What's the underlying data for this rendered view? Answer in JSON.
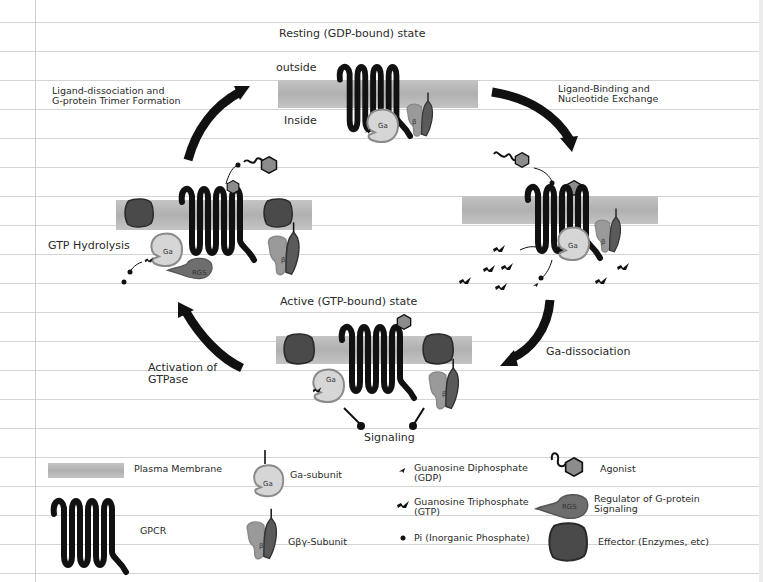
{
  "diagram": {
    "states": {
      "resting": "Resting (GDP-bound) state",
      "active": "Active (GTP-bound) state"
    },
    "membrane_labels": {
      "outside": "outside",
      "inside": "Inside"
    },
    "steps": {
      "ligand_binding": [
        "Ligand-Binding and",
        "Nucleotide Exchange"
      ],
      "ga_dissociation": "Ga-dissociation",
      "activation_gtpase": [
        "Activation of",
        "GTPase"
      ],
      "gtp_hydrolysis": "GTP Hydrolysis",
      "ligand_dissociation": [
        "Ligand-dissociation and",
        "G-protein Trimer Formation"
      ],
      "signaling": "Signaling"
    },
    "shape_labels": {
      "ga": "Ga",
      "beta": "β",
      "gamma": "γ",
      "rgs": "RGS",
      "effector": "Effector"
    }
  },
  "legend": {
    "items": [
      {
        "key": "plasma-membrane",
        "label": "Plasma Membrane"
      },
      {
        "key": "gpcr",
        "label": "GPCR"
      },
      {
        "key": "ga-subunit",
        "label": "Ga-subunit"
      },
      {
        "key": "gby-subunit",
        "label": "Gβγ-Subunit"
      },
      {
        "key": "gdp",
        "label": [
          "Guanosine Diphosphate",
          "(GDP)"
        ]
      },
      {
        "key": "gtp",
        "label": [
          "Guanosine Triphosphate",
          "(GTP)"
        ]
      },
      {
        "key": "pi",
        "label": "Pi (Inorganic Phosphate)"
      },
      {
        "key": "agonist",
        "label": "Agonist"
      },
      {
        "key": "rgs",
        "label": [
          "Regulator of G-protein",
          "Signaling"
        ]
      },
      {
        "key": "effector",
        "label": "Effector (Enzymes, etc)"
      }
    ]
  },
  "colors": {
    "membrane": "#b8b8b8",
    "gpcr": "#111111",
    "ga_fill": "#d6d6d6",
    "ga_stroke": "#8a8a8a",
    "beta_fill": "#9a9a9a",
    "gamma_fill": "#5a5a5a",
    "effector_fill": "#4a4a4a",
    "rgs_fill": "#6e6e6e",
    "agonist_fill": "#8c8c8c",
    "paper_line": "#d4d4d4"
  }
}
